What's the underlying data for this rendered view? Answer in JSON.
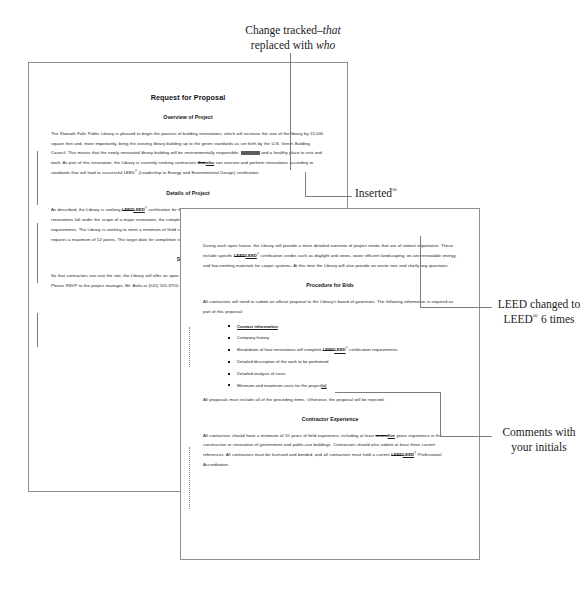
{
  "annotations": [
    {
      "id": "tracked",
      "name": "annotation-change-tracked",
      "line1": "Change tracked–",
      "em1": "that",
      "line2": "replaced with ",
      "em2": "who"
    },
    {
      "id": "inserted",
      "name": "annotation-inserted-symbol",
      "text": "Inserted",
      "sup": "®"
    },
    {
      "id": "leed",
      "name": "annotation-leed-changed",
      "line1": "LEED changed to",
      "line2a": "LEED",
      "sup": "®",
      "line2b": " 6 times"
    },
    {
      "id": "comments",
      "name": "annotation-comments-initials",
      "line1": "Comments with",
      "line2": "your initials"
    }
  ],
  "documents": {
    "back_page": {
      "title": "Request for Proposal",
      "sections": [
        {
          "heading": "Overview of Project",
          "paragraphs": [
            {
              "runs": [
                {
                  "t": "The Klamath Falls Public Library is pleased to begin the process of building renovations, which will increase the size of the library by 15,000 square feet and, more importantly, bring the existing library building up to the green standards as set forth by the U.S. Green Building Council. This means that the newly renovated library building will be environmentally responsible, ",
                  "k": "n"
                },
                {
                  "t": "profitable",
                  "k": "redact"
                },
                {
                  "t": " and a healthy place to visit and work. As part of this renovation, the Library is currently seeking contractors ",
                  "k": "n"
                },
                {
                  "t": "that",
                  "k": "del"
                },
                {
                  "t": "who",
                  "k": "ins"
                },
                {
                  "t": " can oversee and perform renovations according to standards that will lead to successful LEED",
                  "k": "n"
                },
                {
                  "t": "®",
                  "k": "sup"
                },
                {
                  "t": " (Leadership in Energy and Environmental Design) certification.",
                  "k": "n"
                }
              ]
            }
          ]
        },
        {
          "heading": "Details of Project",
          "paragraphs": [
            {
              "runs": [
                {
                  "t": "As described, the Library is seeking ",
                  "k": "n"
                },
                {
                  "t": "LEED",
                  "k": "del"
                },
                {
                  "t": "LEED",
                  "k": "ins"
                },
                {
                  "t": "®",
                  "k": "sup"
                },
                {
                  "t": " certification for the renovations and additions to the existing library. Because the renovations fall under the scope of a major renovation, the completed project will need to meet the ",
                  "k": "n"
                },
                {
                  "t": "LEED",
                  "k": "del"
                },
                {
                  "t": "LEED",
                  "k": "ins"
                },
                {
                  "t": "®",
                  "k": "sup"
                },
                {
                  "t": " for New Construction requirements. The Library is seeking to meet a minimum of Gold certification, though it would like to pursue Platinum certification, which requires a maximum of 52 points. The target date for completion is November 30, 2013.",
                  "k": "n"
                }
              ]
            }
          ]
        },
        {
          "heading": "Site Tour",
          "paragraphs": [
            {
              "runs": [
                {
                  "t": "So that contractors can visit the site, the Library will offer an open house on each Friday morning in August, from 8:00 a.m. to 11:00 a.m. Please RSVP to the project manager, Mr. Ávila at (541) 555-9750, ext. 3 or ",
                  "k": "n"
                },
                {
                  "t": "javila",
                  "k": "ins"
                },
                {
                  "t": ". Mr. Ávila will send a confirmation.",
                  "k": "n"
                }
              ]
            }
          ]
        }
      ]
    },
    "front_page": {
      "sections": [
        {
          "heading": "",
          "paragraphs": [
            {
              "runs": [
                {
                  "t": "During each open house, the Library will provide a more detailed overview of project needs that are of utmost importance. These include specific ",
                  "k": "n"
                },
                {
                  "t": "LEED",
                  "k": "del"
                },
                {
                  "t": "LEED",
                  "k": "ins"
                },
                {
                  "t": "®",
                  "k": "sup"
                },
                {
                  "t": " certification credits such as daylight and views, water efficient landscaping, on-site renewable energy, and low-emitting materials for carpet systems. At this time the Library will also provide an onsite tour and clarify any questions.",
                  "k": "n"
                }
              ]
            }
          ]
        },
        {
          "heading": "Procedure for Bids",
          "paragraphs": [
            {
              "runs": [
                {
                  "t": "All contractors will need to submit an official proposal to the Library’s board of governors. The following information is required as part of this proposal:",
                  "k": "n"
                }
              ]
            }
          ],
          "list": [
            [
              {
                "t": "Contact information",
                "k": "ins"
              }
            ],
            [
              {
                "t": "Company history",
                "k": "n"
              }
            ],
            [
              {
                "t": "Breakdown of how renovations will complete ",
                "k": "n"
              },
              {
                "t": "LEED",
                "k": "del"
              },
              {
                "t": "LEED",
                "k": "ins"
              },
              {
                "t": "®",
                "k": "sup"
              },
              {
                "t": " certification requirements.",
                "k": "n"
              }
            ],
            [
              {
                "t": "Detailed description of the work to be performed",
                "k": "n"
              }
            ],
            [
              {
                "t": "Detailed analysis of costs",
                "k": "n"
              }
            ],
            [
              {
                "t": "Minimum and maximum costs for the project",
                "k": "n"
              },
              {
                "t": "(s)",
                "k": "ins"
              }
            ]
          ],
          "closing": [
            {
              "t": "All proposals must include all of the preceding items. Otherwise, the proposal will be rejected.",
              "k": "n"
            }
          ]
        },
        {
          "heading": "Contractor Experience",
          "paragraphs": [
            {
              "runs": [
                {
                  "t": "All contractors should have a minimum of 10 years of field experience, including at least ",
                  "k": "n"
                },
                {
                  "t": "seven",
                  "k": "del"
                },
                {
                  "t": "five",
                  "k": "ins"
                },
                {
                  "t": " years experience in the construction or renovation of government and public-use buildings. Contractors should also submit at least three current references. All contractors must be licensed and bonded, and all contractors must hold a current ",
                  "k": "n"
                },
                {
                  "t": "LEED",
                  "k": "del"
                },
                {
                  "t": "LEED",
                  "k": "ins"
                },
                {
                  "t": "®",
                  "k": "sup"
                },
                {
                  "t": " Professional Accreditation.",
                  "k": "n"
                }
              ]
            }
          ]
        }
      ]
    }
  },
  "colors": {
    "page_border": "#8e8e8e",
    "leader_line": "#7d7d7d",
    "text": "#1a1a1a",
    "redaction": "#5d5d5d",
    "background": "#ffffff"
  }
}
